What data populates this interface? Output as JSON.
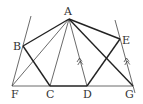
{
  "diagram": {
    "type": "geometry-figure",
    "points": {
      "A": {
        "label": "A",
        "x": 69,
        "y": 19
      },
      "B": {
        "label": "B",
        "x": 23,
        "y": 46
      },
      "E": {
        "label": "E",
        "x": 120,
        "y": 39
      },
      "F": {
        "label": "F",
        "x": 12,
        "y": 86
      },
      "C": {
        "label": "C",
        "x": 50,
        "y": 86
      },
      "D": {
        "label": "D",
        "x": 87,
        "y": 86
      },
      "G": {
        "label": "G",
        "x": 133,
        "y": 86
      }
    },
    "bold_segments": [
      "AB",
      "AE",
      "BC",
      "CD",
      "DE",
      "AG"
    ],
    "thin_segments": [
      "FB-extended",
      "EG-extended",
      "FG",
      "AF",
      "AC",
      "AD"
    ],
    "parallel_marks": [
      "AD",
      "EG"
    ]
  }
}
